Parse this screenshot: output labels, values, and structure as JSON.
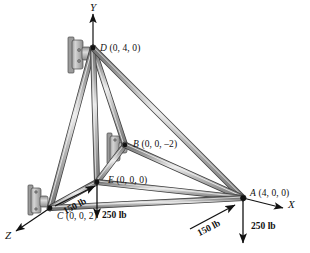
{
  "figure": {
    "type": "engineering-diagram",
    "background_color": "#ffffff",
    "member_color": "#8a8a8a",
    "member_edge_color": "#3a3a3a",
    "member_highlight_color": "#e8e8e8",
    "support_color": "#b0b0b0",
    "joint_color": "#111111",
    "arrow_color": "#111111"
  },
  "axes": [
    {
      "name": "y-axis",
      "label": "Y",
      "direction": "up",
      "label_x": 90,
      "label_y": 3
    },
    {
      "name": "x-axis",
      "label": "X",
      "direction": "right",
      "label_x": 288,
      "label_y": 200
    },
    {
      "name": "z-axis",
      "label": "Z",
      "direction": "down-left",
      "label_x": 6,
      "label_y": 232
    }
  ],
  "joints": [
    {
      "id": "D",
      "label": "D",
      "coords": "(0, 4, 0)",
      "px": 93,
      "py": 48,
      "label_x": 100,
      "label_y": 44,
      "supported": true
    },
    {
      "id": "B",
      "label": "B",
      "coords": "(0, 0, –2)",
      "px": 125,
      "py": 145,
      "label_x": 133,
      "label_y": 140,
      "supported": true
    },
    {
      "id": "E",
      "label": "E",
      "coords": "(0, 0, 0)",
      "px": 97,
      "py": 182,
      "label_x": 108,
      "label_y": 176,
      "supported": false
    },
    {
      "id": "C",
      "label": "C",
      "coords": "(0, 0, 2)",
      "px": 50,
      "py": 208,
      "label_x": 57,
      "label_y": 212,
      "supported": true
    },
    {
      "id": "A",
      "label": "A",
      "coords": "(4, 0, 0)",
      "px": 243,
      "py": 198,
      "label_x": 250,
      "label_y": 190,
      "supported": false
    }
  ],
  "members": [
    {
      "from": "D",
      "to": "C"
    },
    {
      "from": "D",
      "to": "E"
    },
    {
      "from": "D",
      "to": "B"
    },
    {
      "from": "D",
      "to": "A"
    },
    {
      "from": "C",
      "to": "E"
    },
    {
      "from": "C",
      "to": "A"
    },
    {
      "from": "E",
      "to": "B"
    },
    {
      "from": "E",
      "to": "A"
    },
    {
      "from": "B",
      "to": "A"
    }
  ],
  "forces": [
    {
      "id": "force-c-150",
      "magnitude": "150 lb",
      "at_joint": "C",
      "direction": "up-right",
      "label_x": 62,
      "label_y": 206
    },
    {
      "id": "force-c-250",
      "magnitude": "250 lb",
      "at_joint": "C",
      "direction": "down",
      "label_x": 101,
      "label_y": 212
    },
    {
      "id": "force-a-150",
      "magnitude": "150 lb",
      "at_joint": "A",
      "direction": "up-right",
      "label_x": 178,
      "label_y": 226
    },
    {
      "id": "force-a-250",
      "magnitude": "250 lb",
      "at_joint": "A",
      "direction": "down",
      "label_x": 251,
      "label_y": 224
    }
  ]
}
